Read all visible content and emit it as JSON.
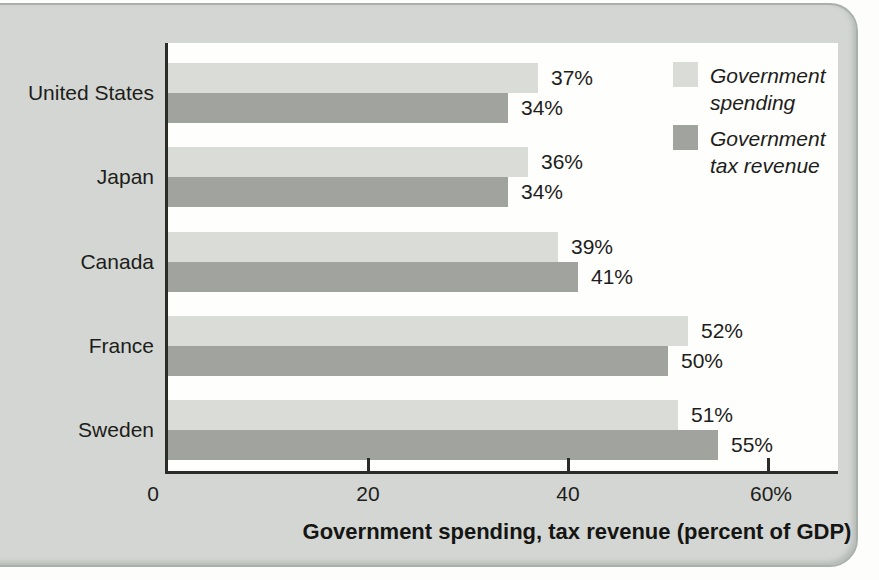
{
  "chart_data": {
    "type": "bar",
    "orientation": "horizontal",
    "title": "",
    "xlabel": "Government spending, tax revenue (percent of GDP)",
    "ylabel": "",
    "categories": [
      "United States",
      "Japan",
      "Canada",
      "France",
      "Sweden"
    ],
    "series": [
      {
        "name": "Government spending",
        "label_lines": [
          "Government",
          "spending"
        ],
        "color": "#dadcd8",
        "values": [
          37,
          36,
          39,
          52,
          51
        ]
      },
      {
        "name": "Government tax revenue",
        "label_lines": [
          "Government",
          "tax revenue"
        ],
        "color": "#a1a39f",
        "values": [
          34,
          34,
          41,
          50,
          55
        ]
      }
    ],
    "value_suffix": "%",
    "value_labels_shown": true,
    "xlim": [
      0,
      67
    ],
    "x_ticks": [
      {
        "value": 0,
        "label": "0",
        "dx": -15
      },
      {
        "value": 20,
        "label": "20",
        "dx": 0
      },
      {
        "value": 40,
        "label": "40",
        "dx": 0
      },
      {
        "value": 60,
        "label": "60%",
        "dx": 3
      }
    ],
    "grid": false,
    "legend_position": "top-right"
  },
  "colors": {
    "panel_background": "#d3d6d2",
    "panel_border": "#a9afab",
    "plot_background": "#fefefc",
    "axis": "#2b2b28",
    "text": "#1d1d1b",
    "spending_bar": "#dadcd8",
    "tax_revenue_bar": "#a1a39f"
  }
}
